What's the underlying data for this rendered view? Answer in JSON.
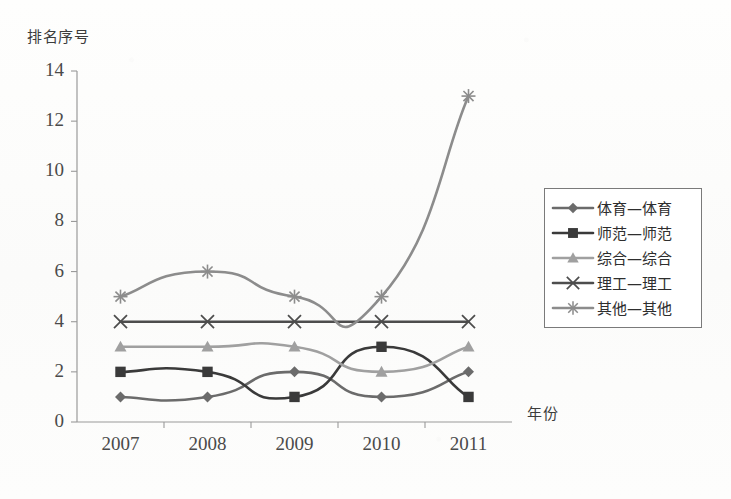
{
  "axis": {
    "ylabel": "排名序号",
    "xlabel": "年份",
    "y_ticks": [
      "0",
      "2",
      "4",
      "6",
      "8",
      "10",
      "12",
      "14"
    ],
    "x_ticks": [
      "2007",
      "2008",
      "2009",
      "2010",
      "2011"
    ]
  },
  "legend": {
    "items": [
      {
        "label": "体育—体育",
        "marker": "diamond-marker",
        "color": "#6b6b6b"
      },
      {
        "label": "师范—师范",
        "marker": "square-marker",
        "color": "#3a3a3a"
      },
      {
        "label": "综合—综合",
        "marker": "triangle-marker",
        "color": "#a0a0a0"
      },
      {
        "label": "理工—理工",
        "marker": "cross-x-marker",
        "color": "#4d4d4d"
      },
      {
        "label": "其他—其他",
        "marker": "asterisk-marker",
        "color": "#8c8c8c"
      }
    ]
  },
  "chart_data": {
    "type": "line",
    "title": "",
    "xlabel": "年份",
    "ylabel": "排名序号",
    "categories": [
      "2007",
      "2008",
      "2009",
      "2010",
      "2011"
    ],
    "ylim": [
      0,
      14
    ],
    "ytick_step": 2,
    "grid": false,
    "legend_position": "right",
    "smooth": true,
    "series": [
      {
        "name": "体育—体育",
        "marker": "diamond",
        "color": "#6b6b6b",
        "values": [
          1,
          1,
          2,
          1,
          2
        ]
      },
      {
        "name": "师范—师范",
        "marker": "square",
        "color": "#3a3a3a",
        "values": [
          2,
          2,
          1,
          3,
          1
        ]
      },
      {
        "name": "综合—综合",
        "marker": "triangle",
        "color": "#a0a0a0",
        "values": [
          3,
          3,
          3,
          2,
          3
        ]
      },
      {
        "name": "理工—理工",
        "marker": "x",
        "color": "#4d4d4d",
        "values": [
          4,
          4,
          4,
          4,
          4
        ]
      },
      {
        "name": "其他—其他",
        "marker": "asterisk",
        "color": "#8c8c8c",
        "values": [
          5,
          6,
          5,
          5,
          13
        ]
      }
    ]
  }
}
